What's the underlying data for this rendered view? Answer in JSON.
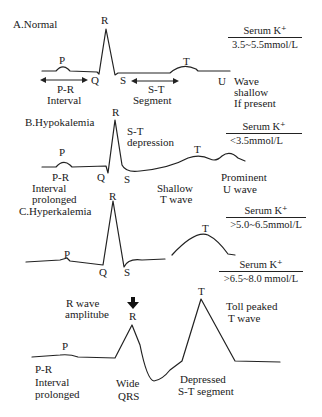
{
  "panels": [
    {
      "title": "A.Normal",
      "serum": {
        "label": "Serum K⁺",
        "value": "3.5~5.5mmol/L"
      },
      "labels": {
        "P": "P",
        "R": "R",
        "Q": "Q",
        "S": "S",
        "T": "T",
        "U": "U",
        "pr_1": "P-R",
        "pr_2": "Interval",
        "st_1": "S-T",
        "st_2": "Segment",
        "u_1": "Wave",
        "u_2": "shallow",
        "u_3": "If present"
      }
    },
    {
      "title": "B.Hypokalemia",
      "serum": {
        "label": "Serum K⁺",
        "value": "<3.5mmol/L"
      },
      "labels": {
        "P": "P",
        "R": "R",
        "Q": "Q",
        "S": "S",
        "T": "T",
        "st_1": "S-T",
        "st_2": "depression",
        "pr_1": "P-R",
        "pr_2": "Interval",
        "pr_3": "prolonged",
        "tw_1": "Shallow",
        "tw_2": "T wave",
        "u_1": "Prominent",
        "u_2": "U wave"
      }
    },
    {
      "title": "C.Hyperkalemia",
      "serum": {
        "label": "Serum K⁺",
        "value": ">5.0~6.5mmol/L"
      },
      "labels": {
        "P": "P",
        "R": "R",
        "Q": "Q",
        "S": "S",
        "T": "T"
      }
    },
    {
      "title": "",
      "serum": {
        "label": "Serum K⁺",
        "value": ">6.5~8.0 mmol/L"
      },
      "labels": {
        "P": "P",
        "R": "R",
        "T": "T",
        "ra_1": "R wave",
        "ra_2": "amplitube",
        "pr_1": "P-R",
        "pr_2": "Interval",
        "pr_3": "prolonged",
        "qrs_1": "Wide",
        "qrs_2": "QRS",
        "st_1": "Depressed",
        "st_2": "S-T segment",
        "tw_1": "Toll  peaked",
        "tw_2": "T wave"
      }
    }
  ]
}
